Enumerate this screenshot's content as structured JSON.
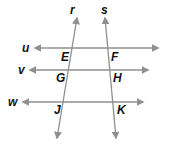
{
  "figure": {
    "line_color": "#8f8f8f",
    "label_color": "#111111",
    "lines": {
      "r": {
        "label": "r"
      },
      "s": {
        "label": "s"
      },
      "u": {
        "label": "u"
      },
      "v": {
        "label": "v"
      },
      "w": {
        "label": "w"
      }
    },
    "points": {
      "E": {
        "label": "E",
        "on": [
          "r",
          "u"
        ]
      },
      "F": {
        "label": "F",
        "on": [
          "s",
          "u"
        ]
      },
      "G": {
        "label": "G",
        "on": [
          "r",
          "v"
        ]
      },
      "H": {
        "label": "H",
        "on": [
          "s",
          "v"
        ]
      },
      "J": {
        "label": "J",
        "on": [
          "r",
          "w"
        ]
      },
      "K": {
        "label": "K",
        "on": [
          "s",
          "w"
        ]
      }
    }
  }
}
